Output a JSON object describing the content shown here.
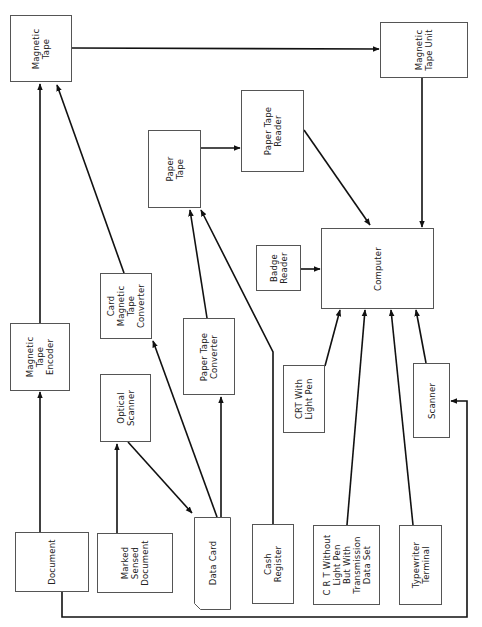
{
  "diagram": {
    "type": "data-flow",
    "orientation": "rotated-90-ccw",
    "line_color": "#111111",
    "box_border_color": "#555555",
    "nodes": {
      "magnetic_tape": {
        "label": "Magnetic\nTape"
      },
      "magnetic_tape_unit": {
        "label": "Magnetic\nTape Unit"
      },
      "paper_tape_reader": {
        "label": "Paper Tape\nReader"
      },
      "paper_tape": {
        "label": "Paper\nTape"
      },
      "badge_reader": {
        "label": "Badge\nReader"
      },
      "computer": {
        "label": "Computer"
      },
      "card_magnetic_tape_converter": {
        "label": "Card\nMagnetic\nTape\nConverter"
      },
      "magnetic_tape_encoder": {
        "label": "Magnetic\nTape\nEncoder"
      },
      "paper_tape_converter": {
        "label": "Paper Tape\nConverter"
      },
      "optical_scanner": {
        "label": "Optical\nScanner"
      },
      "crt_with_light_pen": {
        "label": "CRT With\nLight Pen"
      },
      "scanner": {
        "label": "Scanner"
      },
      "document": {
        "label": "Document"
      },
      "marked_sensed_document": {
        "label": "Marked\nSensed\nDocument"
      },
      "data_card": {
        "label": "Data Card"
      },
      "cash_register": {
        "label": "Cash\nRegister"
      },
      "crt_without_light_pen": {
        "label": "C R T Without\nLight Pen\nBut With\nTransmission\nData Set"
      },
      "typewriter_terminal": {
        "label": "Typewriter\nTerminal"
      }
    },
    "edges": [
      {
        "from": "document",
        "to": "magnetic_tape_encoder"
      },
      {
        "from": "magnetic_tape_encoder",
        "to": "magnetic_tape"
      },
      {
        "from": "card_magnetic_tape_converter",
        "to": "magnetic_tape"
      },
      {
        "from": "magnetic_tape",
        "to": "magnetic_tape_unit"
      },
      {
        "from": "magnetic_tape_unit",
        "to": "computer"
      },
      {
        "from": "marked_sensed_document",
        "to": "optical_scanner"
      },
      {
        "from": "optical_scanner",
        "to": "data_card"
      },
      {
        "from": "data_card",
        "to": "card_magnetic_tape_converter"
      },
      {
        "from": "data_card",
        "to": "paper_tape_converter"
      },
      {
        "from": "paper_tape_converter",
        "to": "paper_tape"
      },
      {
        "from": "cash_register",
        "to": "paper_tape"
      },
      {
        "from": "paper_tape",
        "to": "paper_tape_reader"
      },
      {
        "from": "paper_tape_reader",
        "to": "computer"
      },
      {
        "from": "badge_reader",
        "to": "computer"
      },
      {
        "from": "crt_with_light_pen",
        "to": "computer"
      },
      {
        "from": "crt_without_light_pen",
        "to": "computer"
      },
      {
        "from": "typewriter_terminal",
        "to": "computer"
      },
      {
        "from": "scanner",
        "to": "computer"
      },
      {
        "from": "document",
        "to": "scanner"
      }
    ]
  }
}
